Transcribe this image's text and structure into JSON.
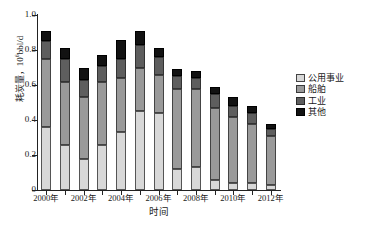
{
  "chart_data": {
    "type": "bar",
    "stacked": true,
    "title": "",
    "xlabel": "时间",
    "ylabel": "耗炭量，10⁶bbl/d",
    "ylabel_text": "耗炭量，10",
    "ylabel_exp": "6",
    "ylabel_unit": "bbl/d",
    "ylim": [
      0,
      1.0
    ],
    "yticks": [
      0,
      0.2,
      0.4,
      0.6,
      0.8,
      1.0
    ],
    "ytick_labels": [
      "0",
      "0.2",
      "0.4",
      "0.6",
      "0.8",
      "1.0"
    ],
    "grid": false,
    "legend_position": "right",
    "categories": [
      "2000年",
      "2001年",
      "2002年",
      "2003年",
      "2004年",
      "2005年",
      "2006年",
      "2007年",
      "2008年",
      "2009年",
      "2010年",
      "2011年",
      "2012年"
    ],
    "xtick_labels_shown": [
      "2000年",
      "2002年",
      "2004年",
      "2006年",
      "2008年",
      "2010年",
      "2012年"
    ],
    "series": [
      {
        "name": "公用事业",
        "color": "#d8d8d8",
        "values": [
          0.36,
          0.26,
          0.18,
          0.26,
          0.33,
          0.45,
          0.44,
          0.12,
          0.13,
          0.06,
          0.04,
          0.04,
          0.03
        ]
      },
      {
        "name": "船舶",
        "color": "#9a9a9a",
        "values": [
          0.39,
          0.36,
          0.35,
          0.36,
          0.31,
          0.25,
          0.22,
          0.46,
          0.45,
          0.41,
          0.38,
          0.34,
          0.28
        ]
      },
      {
        "name": "工业",
        "color": "#5e5e5e",
        "values": [
          0.1,
          0.13,
          0.1,
          0.09,
          0.11,
          0.13,
          0.1,
          0.07,
          0.06,
          0.08,
          0.06,
          0.06,
          0.04
        ]
      },
      {
        "name": "其他",
        "color": "#121212",
        "values": [
          0.06,
          0.06,
          0.07,
          0.06,
          0.11,
          0.08,
          0.05,
          0.04,
          0.04,
          0.04,
          0.05,
          0.04,
          0.03
        ]
      }
    ],
    "totals": [
      0.91,
      0.81,
      0.7,
      0.77,
      0.86,
      0.91,
      0.81,
      0.69,
      0.68,
      0.59,
      0.53,
      0.48,
      0.38
    ]
  },
  "legend": {
    "items": [
      {
        "label": "公用事业"
      },
      {
        "label": "船舶"
      },
      {
        "label": "工业"
      },
      {
        "label": "其他"
      }
    ]
  }
}
